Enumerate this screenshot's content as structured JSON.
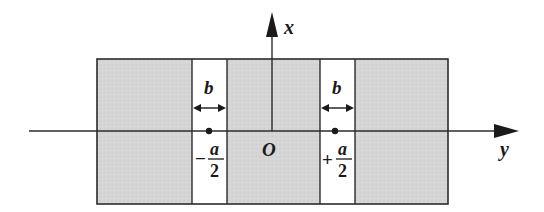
{
  "figure": {
    "colors": {
      "background": "#ffffff",
      "shaded_region": "#d4d4d4",
      "slit": "#ffffff",
      "line": "#2b2b2b",
      "text": "#1a1a1a"
    }
  },
  "axes": {
    "x_label": "x",
    "y_label": "y",
    "origin_label": "O"
  },
  "slits": [
    {
      "id": "left",
      "width_label": "b",
      "position_sign": "−",
      "position_numerator": "a",
      "position_denominator": "2"
    },
    {
      "id": "right",
      "width_label": "b",
      "position_sign": "+",
      "position_numerator": "a",
      "position_denominator": "2"
    }
  ]
}
